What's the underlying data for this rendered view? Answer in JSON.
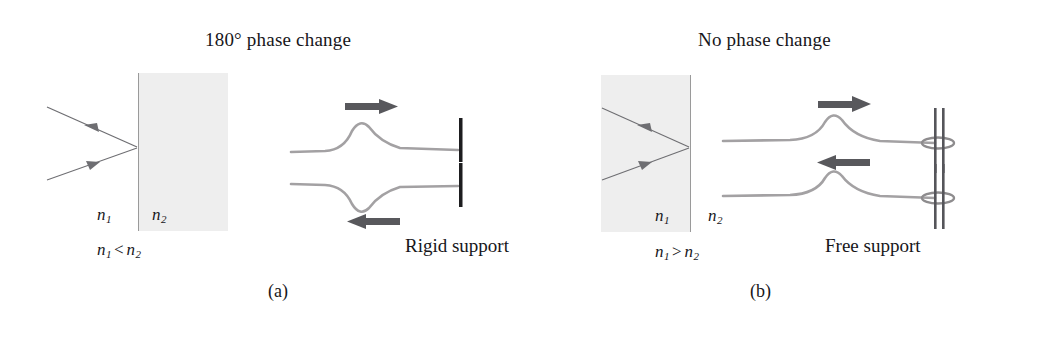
{
  "figure": {
    "background_color": "#ffffff",
    "ink_color": "#17161a",
    "medium_fill_color": "#eeeeee",
    "arrow_color": "#58585c",
    "wave_color": "#9c9a9c",
    "ray_color": "#6e6e72"
  },
  "panel_a": {
    "heading": "180° phase change",
    "caption": "(a)",
    "support_label": "Rigid support",
    "medium_labels": {
      "left_symbol": "n",
      "left_subscript": "1",
      "right_symbol": "n",
      "right_subscript": "2"
    },
    "relation": {
      "left_symbol": "n",
      "left_subscript": "1",
      "operator": "<",
      "right_symbol": "n",
      "right_subscript": "2"
    },
    "incident_ray_label": "incident-ray",
    "reflected_ray_label": "reflected-ray",
    "waves": [
      {
        "name": "incident-pulse",
        "direction": "right",
        "polarity": "crest",
        "arrow_glyph": "→"
      },
      {
        "name": "reflected-pulse",
        "direction": "left",
        "polarity": "trough",
        "arrow_glyph": "←"
      }
    ]
  },
  "panel_b": {
    "heading": "No phase change",
    "caption": "(b)",
    "support_label": "Free support",
    "medium_labels": {
      "left_symbol": "n",
      "left_subscript": "1",
      "right_symbol": "n",
      "right_subscript": "2"
    },
    "relation": {
      "left_symbol": "n",
      "left_subscript": "1",
      "operator": ">",
      "right_symbol": "n",
      "right_subscript": "2"
    },
    "incident_ray_label": "incident-ray",
    "reflected_ray_label": "reflected-ray",
    "waves": [
      {
        "name": "incident-pulse",
        "direction": "right",
        "polarity": "crest",
        "arrow_glyph": "→"
      },
      {
        "name": "reflected-pulse",
        "direction": "left",
        "polarity": "crest",
        "arrow_glyph": "←"
      }
    ]
  }
}
